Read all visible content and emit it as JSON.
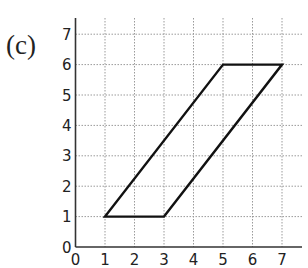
{
  "label": "(c)",
  "chart_data": {
    "type": "line",
    "title": "",
    "xlabel": "",
    "ylabel": "",
    "xlim": [
      0,
      7
    ],
    "ylim": [
      0,
      7
    ],
    "grid": true,
    "x_ticks": [
      "0",
      "1",
      "2",
      "3",
      "4",
      "5",
      "6",
      "7"
    ],
    "y_ticks": [
      "0",
      "1",
      "2",
      "3",
      "4",
      "5",
      "6",
      "7"
    ],
    "series": [
      {
        "name": "parallelogram",
        "closed": true,
        "points": [
          [
            1,
            1
          ],
          [
            3,
            1
          ],
          [
            7,
            6
          ],
          [
            5,
            6
          ]
        ]
      }
    ]
  }
}
